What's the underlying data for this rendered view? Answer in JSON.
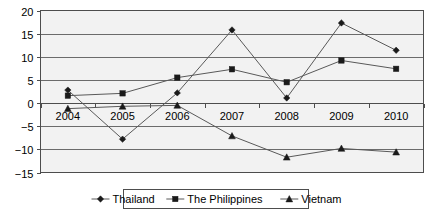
{
  "chart_data": {
    "type": "line",
    "title": "",
    "subtitle": "",
    "xlabel": "",
    "ylabel": "",
    "categories": [
      "2004",
      "2005",
      "2006",
      "2007",
      "2008",
      "2009",
      "2010"
    ],
    "ylim": [
      -15,
      20
    ],
    "yticks": [
      20,
      15,
      10,
      5,
      0,
      -5,
      -10,
      -15
    ],
    "ytick_labels": [
      "20",
      "15",
      "10",
      "5",
      "0",
      "−5",
      "−10",
      "−15"
    ],
    "grid": true,
    "grid_axis": "y",
    "legend_position": "bottom",
    "series": [
      {
        "name": "Thailand",
        "marker": "diamond",
        "values": [
          2.8,
          -7.8,
          2.2,
          15.8,
          1.1,
          17.3,
          11.4
        ]
      },
      {
        "name": "The Philippines",
        "marker": "square",
        "values": [
          1.6,
          2.1,
          5.5,
          7.3,
          4.5,
          9.2,
          7.4
        ]
      },
      {
        "name": "Vietnam",
        "marker": "triangle",
        "values": [
          -1.2,
          -0.7,
          -0.5,
          -7.1,
          -11.7,
          -9.8,
          -10.6
        ]
      }
    ],
    "colors": {
      "series_line": "#595959",
      "marker": "#1a1a1a",
      "gridline": "#6b6b6b",
      "axis": "#4d4d4d",
      "plot_background": "#f2f2f2",
      "page_background": "#ffffff"
    }
  },
  "legend": {
    "items": [
      {
        "label": "Thailand",
        "marker": "diamond"
      },
      {
        "label": "The Philippines",
        "marker": "square"
      },
      {
        "label": "Vietnam",
        "marker": "triangle"
      }
    ]
  }
}
